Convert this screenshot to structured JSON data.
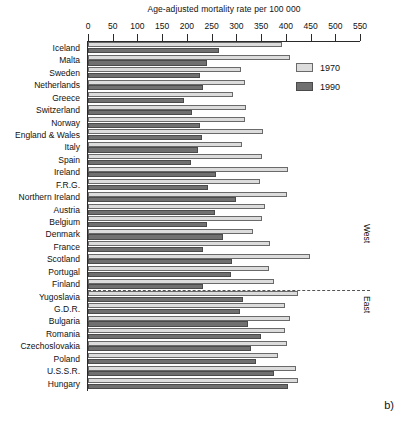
{
  "figure": {
    "panel_tag": "b)",
    "axis_title": "Age-adjusted mortality rate per 100 000",
    "region_west": "West",
    "region_east": "East"
  },
  "legend": {
    "position": "top-right",
    "entries": [
      {
        "label": "1970",
        "color": "#dcdcdc"
      },
      {
        "label": "1990",
        "color": "#707070"
      }
    ]
  },
  "chart_data": {
    "type": "bar",
    "orientation": "horizontal",
    "title": "Age-adjusted mortality rate per 100 000",
    "xlabel": "Age-adjusted mortality rate per 100 000",
    "ylabel": "",
    "xlim": [
      0,
      550
    ],
    "xticks": [
      0,
      50,
      100,
      150,
      200,
      250,
      300,
      350,
      400,
      450,
      500,
      550
    ],
    "grid": false,
    "legend_position": "top-right",
    "categories": [
      "Iceland",
      "Malta",
      "Sweden",
      "Netherlands",
      "Greece",
      "Switzerland",
      "Norway",
      "England & Wales",
      "Italy",
      "Spain",
      "Ireland",
      "F.R.G.",
      "Northern Ireland",
      "Austria",
      "Belgium",
      "Denmark",
      "France",
      "Scotland",
      "Portugal",
      "Finland",
      "Yugoslavia",
      "G.D.R.",
      "Bulgaria",
      "Romania",
      "Czechoslovakia",
      "Poland",
      "U.S.S.R.",
      "Hungary"
    ],
    "groups": [
      {
        "name": "West",
        "categories": [
          "Iceland",
          "Malta",
          "Sweden",
          "Netherlands",
          "Greece",
          "Switzerland",
          "Norway",
          "England & Wales",
          "Italy",
          "Spain",
          "Ireland",
          "F.R.G.",
          "Northern Ireland",
          "Austria",
          "Belgium",
          "Denmark",
          "France",
          "Scotland",
          "Portugal",
          "Finland"
        ]
      },
      {
        "name": "East",
        "categories": [
          "Yugoslavia",
          "G.D.R.",
          "Bulgaria",
          "Romania",
          "Czechoslovakia",
          "Poland",
          "U.S.S.R.",
          "Hungary"
        ]
      }
    ],
    "series": [
      {
        "name": "1970",
        "color": "#dcdcdc",
        "values": [
          392,
          408,
          310,
          318,
          294,
          320,
          318,
          353,
          312,
          352,
          404,
          348,
          402,
          358,
          352,
          334,
          369,
          448,
          365,
          376,
          425,
          398,
          408,
          398,
          402,
          384,
          420,
          424
        ]
      },
      {
        "name": "1990",
        "color": "#707070",
        "values": [
          265,
          240,
          226,
          232,
          194,
          210,
          226,
          230,
          222,
          208,
          258,
          242,
          300,
          256,
          240,
          272,
          232,
          292,
          290,
          232,
          314,
          308,
          324,
          350,
          330,
          340,
          376,
          404
        ]
      }
    ]
  }
}
